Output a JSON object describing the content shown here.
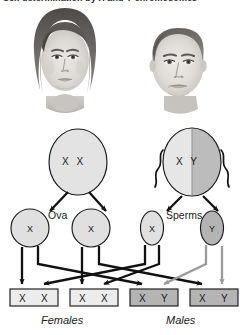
{
  "figure": {
    "title": "Sex determination by X and Y chromosomes",
    "caption_visible": false
  },
  "photos": [
    {
      "name": "female-parent-photo",
      "alt_label": "Female parent",
      "tone": "grayscale"
    },
    {
      "name": "male-parent-photo",
      "alt_label": "Male parent",
      "tone": "grayscale"
    }
  ],
  "parents": {
    "female": {
      "genotype": "X X",
      "allele_left": "X",
      "allele_right": "X",
      "fill": "#e3e3e3"
    },
    "male": {
      "genotype": "X Y",
      "allele_left": "X",
      "allele_right": "Y",
      "fill_left": "#e3e3e3",
      "fill_right": "#b9b9b9"
    }
  },
  "gametes": {
    "ova_label": "Ova",
    "sperm_label": "Sperms",
    "ova": [
      {
        "allele": "X",
        "fill": "#e0e0e0"
      },
      {
        "allele": "X",
        "fill": "#e0e0e0"
      }
    ],
    "sperms": [
      {
        "allele": "X",
        "fill": "#e0e0e0"
      },
      {
        "allele": "Y",
        "fill": "#b4b4b4"
      }
    ]
  },
  "offspring": {
    "boxes": [
      {
        "alleles": [
          "X",
          "X"
        ],
        "sex": "female",
        "fill": "#ececec"
      },
      {
        "alleles": [
          "X",
          "X"
        ],
        "sex": "female",
        "fill": "#ececec"
      },
      {
        "alleles": [
          "X",
          "Y"
        ],
        "sex": "male",
        "fill": "#b4b4b4"
      },
      {
        "alleles": [
          "X",
          "Y"
        ],
        "sex": "male",
        "fill": "#b4b4b4"
      }
    ],
    "female_label": "Females",
    "male_label": "Males"
  },
  "colors": {
    "line_black": "#111111",
    "line_gray": "#9a9a9a",
    "outline": "#1a1a1a",
    "background": "#ffffff"
  }
}
